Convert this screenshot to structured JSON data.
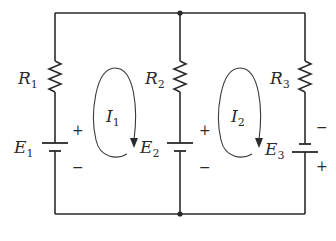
{
  "diagram": {
    "type": "circuit",
    "nodes": [
      "top-junction",
      "bottom-junction"
    ],
    "branches": [
      {
        "position": "left",
        "resistor": {
          "symbol": "R",
          "subscript": "1"
        },
        "source": {
          "symbol": "E",
          "subscript": "1",
          "plus_label": "+",
          "minus_label": "−",
          "plus_side": "top"
        }
      },
      {
        "position": "middle",
        "resistor": {
          "symbol": "R",
          "subscript": "2"
        },
        "source": {
          "symbol": "E",
          "subscript": "2",
          "plus_label": "+",
          "minus_label": "−",
          "plus_side": "top"
        }
      },
      {
        "position": "right",
        "resistor": {
          "symbol": "R",
          "subscript": "3"
        },
        "source": {
          "symbol": "E",
          "subscript": "3",
          "plus_label": "+",
          "minus_label": "−",
          "plus_side": "bottom"
        }
      }
    ],
    "loop_currents": [
      {
        "symbol": "I",
        "subscript": "1",
        "direction": "clockwise",
        "loop": "left"
      },
      {
        "symbol": "I",
        "subscript": "2",
        "direction": "clockwise",
        "loop": "right"
      }
    ],
    "colors": {
      "ink": "#2a2a2a",
      "background": "#ffffff"
    }
  }
}
